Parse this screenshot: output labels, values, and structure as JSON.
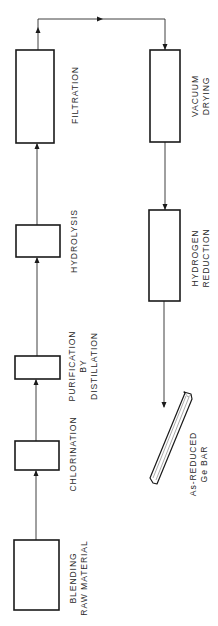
{
  "diagram": {
    "type": "process-flowchart",
    "orientation": "rotated-90-ccw",
    "colors": {
      "stroke": "#1a1a1a",
      "text": "#2a2a2a",
      "background": "#ffffff"
    },
    "steps": [
      {
        "id": "blending",
        "lines": [
          "BLENDING",
          "RAW MATERIAL"
        ]
      },
      {
        "id": "chlorination",
        "lines": [
          "CHLORINATION"
        ]
      },
      {
        "id": "purification",
        "lines": [
          "PURIFICATION",
          "BY",
          "DISTILLATION"
        ]
      },
      {
        "id": "hydrolysis",
        "lines": [
          "HYDROLYSIS"
        ]
      },
      {
        "id": "filtration",
        "lines": [
          "FILTRATION"
        ]
      },
      {
        "id": "vacuum-drying",
        "lines": [
          "VACUUM",
          "DRYING"
        ]
      },
      {
        "id": "hydrogen-reduction",
        "lines": [
          "HYDROGEN",
          "REDUCTION"
        ]
      },
      {
        "id": "ge-bar",
        "lines": [
          "As-REDUCED",
          "Ge BAR"
        ]
      }
    ],
    "flow": [
      [
        "blending",
        "chlorination"
      ],
      [
        "chlorination",
        "purification"
      ],
      [
        "purification",
        "hydrolysis"
      ],
      [
        "hydrolysis",
        "filtration"
      ],
      [
        "filtration",
        "vacuum-drying"
      ],
      [
        "vacuum-drying",
        "hydrogen-reduction"
      ],
      [
        "hydrogen-reduction",
        "ge-bar"
      ]
    ]
  }
}
